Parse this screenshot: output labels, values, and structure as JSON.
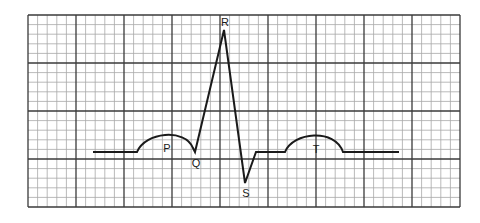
{
  "diagram": {
    "grid": {
      "major_columns": 9,
      "major_rows": 4,
      "minor_per_major": 5
    },
    "waves": [
      {
        "key": "P",
        "label": "P"
      },
      {
        "key": "Q",
        "label": "Q"
      },
      {
        "key": "R",
        "label": "R"
      },
      {
        "key": "S",
        "label": "S"
      },
      {
        "key": "T",
        "label": "T"
      }
    ],
    "colors": {
      "trace": "#1a1a1a",
      "major_grid": "#3a3a3a",
      "minor_grid": "#a8a8a8"
    }
  }
}
